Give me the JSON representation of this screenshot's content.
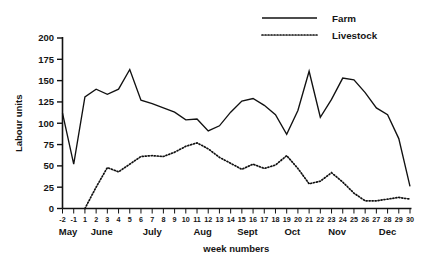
{
  "chart_data": {
    "type": "line",
    "title": "",
    "xlabel": "week numbers",
    "ylabel": "Labour units",
    "ylim": [
      0,
      200
    ],
    "yticks": [
      0,
      25,
      50,
      75,
      100,
      125,
      150,
      175,
      200
    ],
    "grid": false,
    "legend_position": "top-right",
    "x": [
      "-2",
      "-1",
      "1",
      "2",
      "3",
      "4",
      "5",
      "6",
      "7",
      "8",
      "9",
      "10",
      "11",
      "12",
      "13",
      "14",
      "15",
      "16",
      "17",
      "18",
      "19",
      "20",
      "21",
      "22",
      "23",
      "24",
      "25",
      "26",
      "27",
      "28",
      "29",
      "30"
    ],
    "xtick_labels": [
      "-2",
      "-1",
      "1",
      "2",
      "3",
      "4",
      "5",
      "6",
      "7",
      "8",
      "9",
      "10",
      "11",
      "12",
      "13",
      "14",
      "15",
      "16",
      "17",
      "18",
      "19",
      "20",
      "21",
      "22",
      "23",
      "24",
      "25",
      "26",
      "27",
      "28",
      "29",
      "30"
    ],
    "month_groups": [
      {
        "label": "May",
        "start_index": 0,
        "end_index": 1
      },
      {
        "label": "June",
        "start_index": 2,
        "end_index": 5
      },
      {
        "label": "July",
        "start_index": 6,
        "end_index": 10
      },
      {
        "label": "Aug",
        "start_index": 11,
        "end_index": 14
      },
      {
        "label": "Sept",
        "start_index": 15,
        "end_index": 18
      },
      {
        "label": "Oct",
        "start_index": 19,
        "end_index": 22
      },
      {
        "label": "Nov",
        "start_index": 23,
        "end_index": 26
      },
      {
        "label": "Dec",
        "start_index": 27,
        "end_index": 31
      }
    ],
    "series": [
      {
        "name": "Farm",
        "style": "solid",
        "color": "#111111",
        "values": [
          112,
          52,
          131,
          140,
          134,
          140,
          163,
          127,
          123,
          118,
          113,
          104,
          105,
          91,
          97,
          113,
          126,
          129,
          121,
          110,
          87,
          115,
          161,
          107,
          128,
          153,
          151,
          136,
          118,
          110,
          82,
          26
        ]
      },
      {
        "name": "Livestock",
        "style": "dotted",
        "color": "#111111",
        "values": [
          null,
          null,
          0,
          25,
          48,
          43,
          52,
          61,
          62,
          61,
          66,
          73,
          77,
          70,
          60,
          53,
          46,
          52,
          47,
          51,
          62,
          47,
          29,
          32,
          42,
          31,
          18,
          9,
          9,
          11,
          13,
          11
        ]
      }
    ]
  },
  "legend": {
    "items": [
      {
        "label": "Farm",
        "style": "solid"
      },
      {
        "label": "Livestock",
        "style": "dotted"
      }
    ]
  }
}
